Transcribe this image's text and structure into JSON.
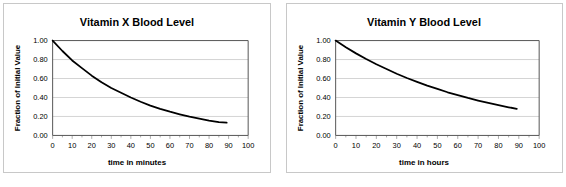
{
  "chart_data": [
    {
      "type": "line",
      "title": "Vitamin X Blood Level",
      "xlabel": "time in minutes",
      "ylabel": "Fraction of Initial Value",
      "xlim": [
        0,
        100
      ],
      "ylim": [
        0,
        1.0
      ],
      "grid": true,
      "legend": "none",
      "xticks": [
        "0",
        "10",
        "20",
        "30",
        "40",
        "50",
        "60",
        "70",
        "80",
        "90",
        "100"
      ],
      "xtick_values": [
        0,
        10,
        20,
        30,
        40,
        50,
        60,
        70,
        80,
        90,
        100
      ],
      "yticks": [
        "0.00",
        "0.20",
        "0.40",
        "0.60",
        "0.80",
        "1.00"
      ],
      "ytick_values": [
        0.0,
        0.2,
        0.4,
        0.6,
        0.8,
        1.0
      ],
      "x": [
        0,
        5,
        10,
        15,
        20,
        25,
        30,
        35,
        40,
        45,
        50,
        55,
        60,
        65,
        70,
        75,
        80,
        85,
        89
      ],
      "values": [
        1.0,
        0.89,
        0.79,
        0.71,
        0.63,
        0.56,
        0.5,
        0.45,
        0.4,
        0.355,
        0.315,
        0.28,
        0.25,
        0.223,
        0.198,
        0.177,
        0.157,
        0.14,
        0.135
      ]
    },
    {
      "type": "line",
      "title": "Vitamin Y Blood Level",
      "xlabel": "time in hours",
      "ylabel": "Fraction of Initial Value",
      "xlim": [
        0,
        100
      ],
      "ylim": [
        0,
        1.0
      ],
      "grid": true,
      "legend": "none",
      "xticks": [
        "0",
        "10",
        "20",
        "30",
        "40",
        "50",
        "60",
        "70",
        "80",
        "90",
        "100"
      ],
      "xtick_values": [
        0,
        10,
        20,
        30,
        40,
        50,
        60,
        70,
        80,
        90,
        100
      ],
      "yticks": [
        "0.00",
        "0.20",
        "0.40",
        "0.60",
        "0.80",
        "1.00"
      ],
      "ytick_values": [
        0.0,
        0.2,
        0.4,
        0.6,
        0.8,
        1.0
      ],
      "x": [
        0,
        5,
        10,
        15,
        20,
        25,
        30,
        35,
        40,
        45,
        50,
        55,
        60,
        65,
        70,
        75,
        80,
        85,
        89
      ],
      "values": [
        1.0,
        0.93,
        0.865,
        0.805,
        0.75,
        0.7,
        0.65,
        0.605,
        0.565,
        0.525,
        0.49,
        0.455,
        0.425,
        0.395,
        0.368,
        0.343,
        0.319,
        0.297,
        0.281
      ]
    }
  ],
  "colors": {
    "curve": "#000000",
    "grid": "#c0c0c0",
    "axis": "#555555",
    "border": "#c8c8c8",
    "background": "#ffffff"
  }
}
